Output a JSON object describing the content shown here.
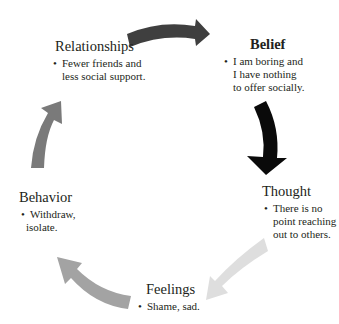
{
  "diagram": {
    "type": "cycle",
    "nodes": [
      {
        "id": "belief",
        "title": "Belief",
        "bold": true,
        "bullet": "•",
        "lines": [
          "I am boring and",
          "I have nothing",
          "to offer socially."
        ]
      },
      {
        "id": "thought",
        "title": "Thought",
        "bold": false,
        "bullet": "•",
        "lines": [
          "There is no",
          "point reaching",
          "out to others."
        ]
      },
      {
        "id": "feelings",
        "title": "Feelings",
        "bold": false,
        "bullet": "•",
        "lines": [
          "Shame, sad."
        ]
      },
      {
        "id": "behavior",
        "title": "Behavior",
        "bold": false,
        "bullet": "•",
        "lines": [
          "Withdraw,",
          "isolate."
        ]
      },
      {
        "id": "relationships",
        "title": "Relationships",
        "bold": false,
        "bullet": "•",
        "lines": [
          "Fewer friends and",
          "less social support."
        ]
      }
    ],
    "arrows": [
      {
        "from": "relationships",
        "to": "belief",
        "color": "#3f3f3f"
      },
      {
        "from": "belief",
        "to": "thought",
        "color": "#0a0a0a"
      },
      {
        "from": "thought",
        "to": "feelings",
        "color": "#dedede"
      },
      {
        "from": "feelings",
        "to": "behavior",
        "color": "#a3a3a3"
      },
      {
        "from": "behavior",
        "to": "relationships",
        "color": "#7a7a7a"
      }
    ]
  }
}
